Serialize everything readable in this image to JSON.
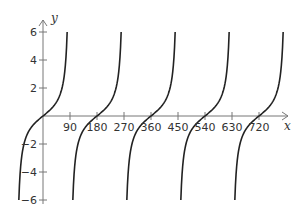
{
  "chart_data": {
    "type": "line",
    "title": "",
    "xlabel": "x",
    "ylabel": "y",
    "function_hint": "y = tan(x), x in degrees (inferred from zero crossings at multiples of 180 and asymptotes near odd multiples of 90)",
    "xlim": [
      0,
      780
    ],
    "ylim": [
      -6,
      6
    ],
    "x_ticks": [
      90,
      180,
      270,
      360,
      450,
      540,
      630,
      720
    ],
    "x_tick_labels": [
      "90",
      "180",
      "270",
      "360",
      "450",
      "540",
      "630",
      "720"
    ],
    "y_ticks": [
      -6,
      -4,
      -2,
      2,
      4,
      6
    ],
    "y_tick_labels": [
      "−6",
      "−4",
      "−2",
      "2",
      "4",
      "6"
    ],
    "zero_crossings": [
      0,
      180,
      360,
      540,
      720
    ],
    "vertical_asymptotes": [
      90,
      270,
      450,
      630
    ],
    "clip_y": 6,
    "grid": false,
    "legend": null,
    "series": [
      {
        "name": "tan(x)",
        "color": "#222222"
      }
    ]
  },
  "layout": {
    "origin_px": [
      43,
      116
    ],
    "px_per_degree": 0.3,
    "px_per_unit_y": 14,
    "x_axis_end_px": 288,
    "y_axis_top_px": 20
  }
}
